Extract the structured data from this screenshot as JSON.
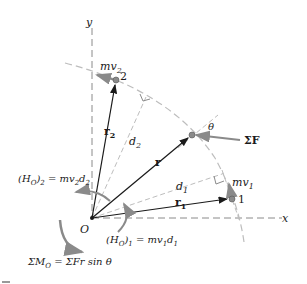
{
  "diagram": {
    "axes": {
      "x_label": "x",
      "y_label": "y",
      "origin_label": "O"
    },
    "points": [
      {
        "id": "1",
        "label": "1",
        "momentum_label": "mv",
        "momentum_sub": "1"
      },
      {
        "id": "2",
        "label": "2",
        "momentum_label": "mv",
        "momentum_sub": "2"
      }
    ],
    "vectors": {
      "r": "r",
      "r1": {
        "main": "r",
        "sub": "1"
      },
      "r2": {
        "main": "r",
        "sub": "2"
      }
    },
    "distances": {
      "d1": {
        "main": "d",
        "sub": "1"
      },
      "d2": {
        "main": "d",
        "sub": "2"
      }
    },
    "force": {
      "label": "ΣF",
      "angle_label": "θ"
    },
    "equations": {
      "h2": {
        "prefix": "(H",
        "sub_o": "O",
        "close": ")",
        "sub": "2",
        "rhs": " = mv",
        "rhs_sub1": "2",
        "rhs_d": "d",
        "rhs_sub2": "2"
      },
      "h1": {
        "prefix": "(H",
        "sub_o": "O",
        "close": ")",
        "sub": "1",
        "rhs": " = mv",
        "rhs_sub1": "1",
        "rhs_d": "d",
        "rhs_sub2": "1"
      },
      "moment": {
        "lhs": "ΣM",
        "lhs_sub": "O",
        "rhs": " = ΣFr sin θ"
      }
    },
    "colors": {
      "ink": "#1a1a1a",
      "gray": "#8a8a8a",
      "light_gray": "#bdbdbd"
    }
  }
}
